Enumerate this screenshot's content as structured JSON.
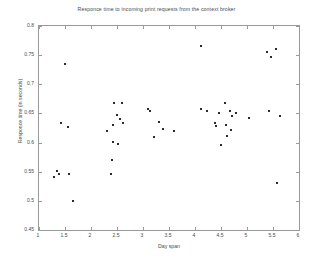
{
  "chart_data": {
    "type": "scatter",
    "title": "Responce time to incoming print requests from the context broker",
    "xlabel": "Day span",
    "ylabel": "Responce time (in seconds)",
    "xlim": [
      1,
      6
    ],
    "ylim": [
      0.45,
      0.8
    ],
    "xticks": [
      "1",
      "1.5",
      "2",
      "2.5",
      "3",
      "3.5",
      "4",
      "4.5",
      "5",
      "5.5",
      "6"
    ],
    "xtick_values": [
      1,
      1.5,
      2,
      2.5,
      3,
      3.5,
      4,
      4.5,
      5,
      5.5,
      6
    ],
    "yticks": [
      "0.45",
      "0.5",
      "0.55",
      "0.6",
      "0.65",
      "0.7",
      "0.75",
      "0.8"
    ],
    "ytick_values": [
      0.45,
      0.5,
      0.55,
      0.6,
      0.65,
      0.7,
      0.75,
      0.8
    ],
    "grid": false,
    "legend": false,
    "marker": "dot",
    "marker_color": "#2b2b2b",
    "axis_color": "#9a9a9a",
    "background": "#ffffff",
    "series": [
      {
        "name": "response times",
        "points": [
          [
            1.29,
            0.541
          ],
          [
            1.35,
            0.551
          ],
          [
            1.38,
            0.546
          ],
          [
            1.43,
            0.634
          ],
          [
            1.5,
            0.735
          ],
          [
            1.55,
            0.626
          ],
          [
            1.57,
            0.546
          ],
          [
            1.65,
            0.499
          ],
          [
            2.3,
            0.62
          ],
          [
            2.39,
            0.546
          ],
          [
            2.41,
            0.57
          ],
          [
            2.42,
            0.601
          ],
          [
            2.43,
            0.63
          ],
          [
            2.44,
            0.668
          ],
          [
            2.5,
            0.648
          ],
          [
            2.52,
            0.598
          ],
          [
            2.56,
            0.64
          ],
          [
            2.6,
            0.668
          ],
          [
            2.62,
            0.633
          ],
          [
            3.09,
            0.657
          ],
          [
            3.14,
            0.654
          ],
          [
            3.22,
            0.61
          ],
          [
            3.31,
            0.635
          ],
          [
            3.38,
            0.623
          ],
          [
            3.6,
            0.62
          ],
          [
            4.11,
            0.766
          ],
          [
            4.12,
            0.657
          ],
          [
            4.24,
            0.655
          ],
          [
            4.38,
            0.633
          ],
          [
            4.41,
            0.628
          ],
          [
            4.47,
            0.651
          ],
          [
            4.5,
            0.595
          ],
          [
            4.57,
            0.668
          ],
          [
            4.6,
            0.631
          ],
          [
            4.62,
            0.612
          ],
          [
            4.68,
            0.655
          ],
          [
            4.7,
            0.622
          ],
          [
            4.72,
            0.645
          ],
          [
            4.78,
            0.65
          ],
          [
            5.03,
            0.642
          ],
          [
            5.38,
            0.756
          ],
          [
            5.42,
            0.654
          ],
          [
            5.46,
            0.746
          ],
          [
            5.55,
            0.761
          ],
          [
            5.58,
            0.531
          ],
          [
            5.64,
            0.645
          ]
        ]
      }
    ]
  }
}
